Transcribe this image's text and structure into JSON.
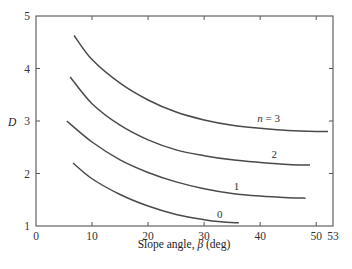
{
  "chart_data": {
    "type": "line",
    "title": "",
    "xlabel": "Slope angle, β (deg)",
    "xlabel_parts": {
      "text": "Slope angle, ",
      "symbol": "β",
      "unit": " (deg)"
    },
    "ylabel": "D",
    "xlim": [
      0,
      53
    ],
    "ylim": [
      1,
      5
    ],
    "xticks": [
      0,
      10,
      20,
      30,
      40,
      50,
      53
    ],
    "yticks": [
      1,
      2,
      3,
      4,
      5
    ],
    "grid": false,
    "legend": "inline curve labels",
    "series": [
      {
        "name": "n = 3",
        "label": "n = 3",
        "label_pos": [
          41.5,
          2.98
        ],
        "x": [
          6.8,
          10,
          15,
          20,
          25,
          30,
          35,
          40,
          45,
          50,
          52.1
        ],
        "y": [
          4.63,
          4.17,
          3.72,
          3.4,
          3.17,
          3.02,
          2.92,
          2.86,
          2.82,
          2.8,
          2.8
        ]
      },
      {
        "name": "n = 2",
        "label": "2",
        "label_pos": [
          42.5,
          2.3
        ],
        "x": [
          6.1,
          10,
          15,
          20,
          25,
          30,
          35,
          40,
          45,
          48.9
        ],
        "y": [
          3.84,
          3.33,
          2.92,
          2.64,
          2.45,
          2.34,
          2.26,
          2.21,
          2.17,
          2.16
        ]
      },
      {
        "name": "n = 1",
        "label": "1",
        "label_pos": [
          35.8,
          1.68
        ],
        "x": [
          5.5,
          10,
          15,
          20,
          25,
          30,
          35,
          40,
          45,
          48.1
        ],
        "y": [
          3.0,
          2.6,
          2.26,
          2.02,
          1.84,
          1.71,
          1.62,
          1.57,
          1.54,
          1.53
        ]
      },
      {
        "name": "n = 0",
        "label": "0",
        "label_pos": [
          32.8,
          1.15
        ],
        "x": [
          6.6,
          10,
          15,
          20,
          25,
          30,
          33,
          36.2
        ],
        "y": [
          2.2,
          1.9,
          1.6,
          1.38,
          1.22,
          1.12,
          1.08,
          1.06
        ]
      }
    ]
  },
  "axes": {
    "y_label": "D",
    "x_label_prefix": "Slope angle, ",
    "x_label_symbol": "β",
    "x_label_suffix": " (deg)"
  },
  "colors": {
    "curve": "#4a4a4a",
    "axis": "#555555",
    "text": "#333333"
  }
}
